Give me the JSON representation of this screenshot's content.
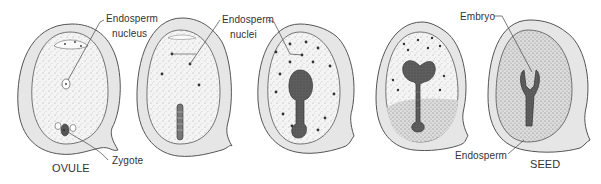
{
  "colors": {
    "coat_fill": "#e6e6e6",
    "coat_stroke": "#555555",
    "endosperm_fill": "#f1f1f1",
    "embryo_fill": "#5a5a5a",
    "dot": "#333333",
    "label": "#333333"
  },
  "stages": [
    {
      "id": "ovule",
      "caption": "OVULE"
    },
    {
      "id": "zygote-division",
      "caption": ""
    },
    {
      "id": "proembryo",
      "caption": ""
    },
    {
      "id": "heart-stage",
      "caption": ""
    },
    {
      "id": "seed",
      "caption": "SEED"
    }
  ],
  "labels": {
    "endosperm_nucleus_line1": "Endosperm",
    "endosperm_nucleus_line2": "nucleus",
    "endosperm_nuclei_line1": "Endosperm",
    "endosperm_nuclei_line2": "nuclei",
    "zygote": "Zygote",
    "embryo": "Embryo",
    "endosperm": "Endosperm",
    "ovule_caption": "OVULE",
    "seed_caption": "SEED"
  }
}
